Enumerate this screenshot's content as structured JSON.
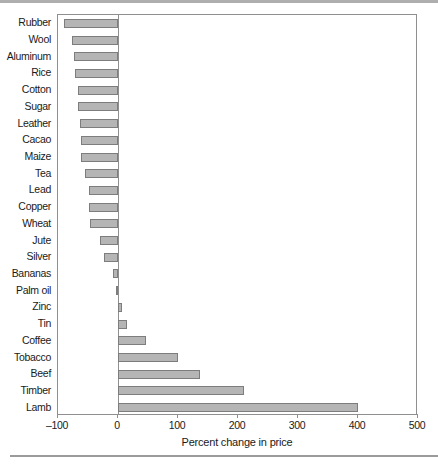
{
  "figure": {
    "background": "#ffffff",
    "top_rule_color": "#aeaeae",
    "bottom_rule_color": "#9b9b9b"
  },
  "chart_data": {
    "type": "bar",
    "orientation": "horizontal",
    "title": "",
    "xlabel": "Percent change in price",
    "ylabel": "",
    "xlim": [
      -100,
      500
    ],
    "xticks": [
      -100,
      0,
      100,
      200,
      300,
      400,
      500
    ],
    "xtick_labels": [
      "–100",
      "0",
      "100",
      "200",
      "300",
      "400",
      "500"
    ],
    "grid": false,
    "legend": null,
    "bar_fill": "#b5b5b5",
    "bar_border": "#7d7d7d",
    "frame_color": "#8f8f8f",
    "text_color": "#1a1a1a",
    "categories": [
      "Rubber",
      "Wool",
      "Aluminum",
      "Rice",
      "Cotton",
      "Sugar",
      "Leather",
      "Cacao",
      "Maize",
      "Tea",
      "Lead",
      "Copper",
      "Wheat",
      "Jute",
      "Silver",
      "Bananas",
      "Palm oil",
      "Zinc",
      "Tin",
      "Coffee",
      "Tobacco",
      "Beef",
      "Timber",
      "Lamb"
    ],
    "values": [
      -90,
      -77,
      -73,
      -71,
      -67,
      -66,
      -64,
      -62,
      -61,
      -55,
      -48,
      -48,
      -47,
      -30,
      -23,
      -8,
      -3,
      6,
      15,
      46,
      100,
      136,
      210,
      400
    ]
  }
}
